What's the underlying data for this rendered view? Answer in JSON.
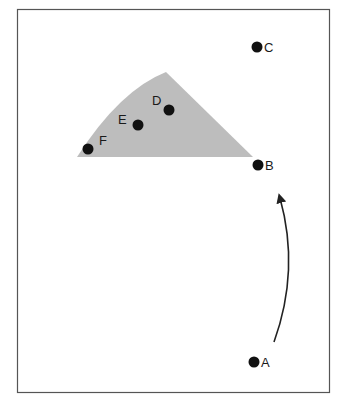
{
  "diagram": {
    "type": "point-diagram",
    "frame": {
      "x": 17,
      "y": 9,
      "width": 312,
      "height": 383
    },
    "region": {
      "color": "#bdbdbd",
      "description": "shaded triangular region with curved left edge"
    },
    "points": [
      {
        "id": "A",
        "label": "A",
        "cx": 254,
        "cy": 362
      },
      {
        "id": "B",
        "label": "B",
        "cx": 258,
        "cy": 165
      },
      {
        "id": "C",
        "label": "C",
        "cx": 257,
        "cy": 47
      },
      {
        "id": "D",
        "label": "D",
        "cx": 169,
        "cy": 110
      },
      {
        "id": "E",
        "label": "E",
        "cx": 138,
        "cy": 125
      },
      {
        "id": "F",
        "label": "F",
        "cx": 88,
        "cy": 149
      }
    ],
    "arrow": {
      "from": "A",
      "to": "B",
      "description": "curved arrow from A toward B"
    },
    "colors": {
      "point": "#111111",
      "frame": "#555555",
      "arrow": "#222222"
    }
  }
}
